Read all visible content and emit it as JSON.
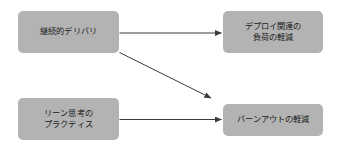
{
  "diagram": {
    "type": "flow-diagram",
    "background_color": "#ffffff",
    "node_fill_color": "#b3b3b3",
    "edge_color": "#3c3c3c",
    "nodes": [
      {
        "id": "continuous-delivery",
        "label": "継続的デリバリ",
        "position": "top-left"
      },
      {
        "id": "deploy-burden",
        "label": "デプロイ関連の\n負荷の軽減",
        "position": "top-right"
      },
      {
        "id": "lean-practices",
        "label": "リーン思考の\nプラクティス",
        "position": "bottom-left"
      },
      {
        "id": "burnout",
        "label": "バーンアウトの軽減",
        "position": "bottom-right"
      }
    ],
    "edges": [
      {
        "id": "cd-to-deploy-burden",
        "from": "continuous-delivery",
        "to": "deploy-burden",
        "arrowhead": "filled-triangle"
      },
      {
        "id": "cd-to-burnout",
        "from": "continuous-delivery",
        "to": "burnout",
        "arrowhead": "filled-triangle"
      },
      {
        "id": "lean-to-burnout",
        "from": "lean-practices",
        "to": "burnout",
        "arrowhead": "filled-triangle"
      }
    ]
  }
}
